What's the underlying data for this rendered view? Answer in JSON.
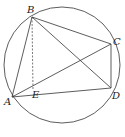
{
  "figure": {
    "type": "geometry",
    "circle": {
      "cx": 62,
      "cy": 65,
      "r": 58
    },
    "points": {
      "A": {
        "label": "A",
        "x": 12,
        "y": 97
      },
      "B": {
        "label": "B",
        "x": 32,
        "y": 17
      },
      "C": {
        "label": "C",
        "x": 111,
        "y": 44
      },
      "D": {
        "label": "D",
        "x": 111,
        "y": 88
      },
      "E": {
        "label": "E",
        "x": 33,
        "y": 90
      }
    },
    "segments": [
      {
        "from": "A",
        "to": "B",
        "style": "solid"
      },
      {
        "from": "B",
        "to": "C",
        "style": "solid"
      },
      {
        "from": "C",
        "to": "D",
        "style": "solid"
      },
      {
        "from": "D",
        "to": "A",
        "style": "solid"
      },
      {
        "from": "A",
        "to": "C",
        "style": "solid"
      },
      {
        "from": "B",
        "to": "D",
        "style": "solid"
      },
      {
        "from": "B",
        "to": "E",
        "style": "dashed"
      }
    ],
    "colors": {
      "stroke": "#333333",
      "background": "#ffffff"
    }
  }
}
